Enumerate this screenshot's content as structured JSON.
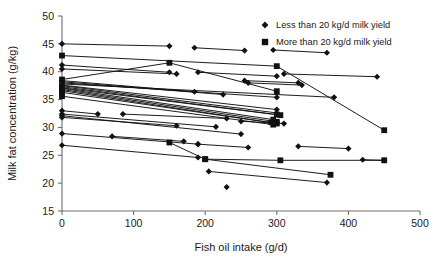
{
  "chart_data": {
    "type": "scatter",
    "title": "",
    "xlabel": "Fish oil intake (g/d)",
    "ylabel": "Milk fat concentration (g/kg)",
    "xlim": [
      0,
      500
    ],
    "ylim": [
      15,
      50
    ],
    "xticks": [
      0,
      100,
      200,
      300,
      400,
      500
    ],
    "yticks": [
      15,
      20,
      25,
      30,
      35,
      40,
      45,
      50
    ],
    "grid": false,
    "legend_position": "top-right",
    "legend": [
      {
        "label": "Less than 20 kg/d milk yield",
        "marker": "diamond",
        "color": "#111111"
      },
      {
        "label": "More than 20 kg/d milk yield",
        "marker": "square",
        "color": "#111111"
      }
    ],
    "series": [
      {
        "name": "study-1",
        "marker": "diamond",
        "points": [
          [
            0,
            45.0
          ],
          [
            150,
            44.6
          ]
        ]
      },
      {
        "name": "study-2",
        "marker": "diamond",
        "points": [
          [
            185,
            44.3
          ],
          [
            255,
            43.8
          ]
        ]
      },
      {
        "name": "study-3",
        "marker": "diamond",
        "points": [
          [
            295,
            43.9
          ],
          [
            370,
            43.4
          ]
        ]
      },
      {
        "name": "study-4",
        "marker": "square",
        "points": [
          [
            0,
            42.9
          ],
          [
            300,
            41.0
          ],
          [
            450,
            29.5
          ]
        ]
      },
      {
        "name": "study-5",
        "marker": "diamond",
        "points": [
          [
            0,
            41.2
          ],
          [
            150,
            39.9
          ]
        ]
      },
      {
        "name": "study-6",
        "marker": "diamond",
        "points": [
          [
            0,
            40.5
          ],
          [
            160,
            39.6
          ]
        ]
      },
      {
        "name": "study-7",
        "marker": "diamond",
        "points": [
          [
            190,
            39.9
          ],
          [
            300,
            39.2
          ]
        ]
      },
      {
        "name": "study-8",
        "marker": "diamond",
        "points": [
          [
            310,
            39.6
          ],
          [
            440,
            39.1
          ]
        ]
      },
      {
        "name": "study-9",
        "marker": "diamond",
        "points": [
          [
            255,
            38.4
          ],
          [
            330,
            38.0
          ]
        ]
      },
      {
        "name": "study-10",
        "marker": "diamond",
        "points": [
          [
            260,
            38.0
          ],
          [
            335,
            37.6
          ]
        ]
      },
      {
        "name": "study-11",
        "marker": "square",
        "points": [
          [
            0,
            38.6
          ],
          [
            150,
            41.6
          ],
          [
            300,
            36.5
          ]
        ]
      },
      {
        "name": "study-12",
        "marker": "diamond",
        "points": [
          [
            0,
            38.4
          ],
          [
            185,
            36.4
          ]
        ]
      },
      {
        "name": "study-13",
        "marker": "diamond",
        "points": [
          [
            0,
            38.2
          ],
          [
            225,
            35.9
          ]
        ]
      },
      {
        "name": "study-14",
        "marker": "diamond",
        "points": [
          [
            0,
            38.0
          ],
          [
            300,
            35.4
          ]
        ]
      },
      {
        "name": "study-15",
        "marker": "diamond",
        "points": [
          [
            0,
            37.8
          ],
          [
            380,
            35.4
          ]
        ]
      },
      {
        "name": "study-16",
        "marker": "diamond",
        "points": [
          [
            0,
            37.6
          ],
          [
            300,
            33.2
          ]
        ]
      },
      {
        "name": "study-17",
        "marker": "diamond",
        "points": [
          [
            0,
            37.5
          ],
          [
            300,
            32.6
          ]
        ]
      },
      {
        "name": "study-18",
        "marker": "square",
        "points": [
          [
            0,
            37.3
          ],
          [
            300,
            32.3
          ]
        ]
      },
      {
        "name": "study-19",
        "marker": "square",
        "points": [
          [
            0,
            37.1
          ],
          [
            305,
            32.2
          ]
        ]
      },
      {
        "name": "study-20",
        "marker": "square",
        "points": [
          [
            0,
            37.0
          ],
          [
            295,
            31.4
          ]
        ]
      },
      {
        "name": "study-21",
        "marker": "square",
        "points": [
          [
            0,
            36.8
          ],
          [
            300,
            31.0
          ]
        ]
      },
      {
        "name": "study-22",
        "marker": "diamond",
        "points": [
          [
            0,
            36.6
          ],
          [
            290,
            30.9
          ]
        ]
      },
      {
        "name": "study-23",
        "marker": "square",
        "points": [
          [
            0,
            36.3
          ],
          [
            300,
            30.7
          ]
        ]
      },
      {
        "name": "study-24",
        "marker": "square",
        "points": [
          [
            0,
            35.6
          ],
          [
            295,
            30.5
          ]
        ]
      },
      {
        "name": "study-25",
        "marker": "diamond",
        "points": [
          [
            0,
            33.0
          ],
          [
            50,
            32.4
          ]
        ]
      },
      {
        "name": "study-26",
        "marker": "diamond",
        "points": [
          [
            0,
            32.4
          ],
          [
            215,
            30.1
          ]
        ]
      },
      {
        "name": "study-27",
        "marker": "diamond",
        "points": [
          [
            85,
            32.4
          ],
          [
            230,
            31.6
          ]
        ]
      },
      {
        "name": "study-28",
        "marker": "diamond",
        "points": [
          [
            0,
            32.1
          ],
          [
            250,
            28.8
          ]
        ]
      },
      {
        "name": "study-29",
        "marker": "diamond",
        "points": [
          [
            0,
            31.8
          ],
          [
            160,
            30.3
          ]
        ]
      },
      {
        "name": "study-30",
        "marker": "diamond",
        "points": [
          [
            250,
            31.1
          ],
          [
            310,
            30.7
          ]
        ]
      },
      {
        "name": "study-31",
        "marker": "diamond",
        "points": [
          [
            0,
            28.9
          ],
          [
            190,
            27.0
          ]
        ]
      },
      {
        "name": "study-32",
        "marker": "diamond",
        "points": [
          [
            70,
            28.4
          ],
          [
            170,
            27.5
          ]
        ]
      },
      {
        "name": "study-33",
        "marker": "square",
        "points": [
          [
            150,
            27.3
          ],
          [
            200,
            24.3
          ],
          [
            305,
            24.1
          ],
          [
            450,
            24.1
          ]
        ]
      },
      {
        "name": "study-34",
        "marker": "square",
        "points": [
          [
            200,
            24.3
          ],
          [
            375,
            21.5
          ]
        ]
      },
      {
        "name": "study-35",
        "marker": "diamond",
        "points": [
          [
            205,
            22.1
          ],
          [
            370,
            20.1
          ]
        ]
      },
      {
        "name": "study-36",
        "marker": "diamond",
        "points": [
          [
            0,
            26.8
          ],
          [
            190,
            24.6
          ]
        ]
      },
      {
        "name": "study-37",
        "marker": "diamond",
        "points": [
          [
            230,
            19.3
          ]
        ]
      },
      {
        "name": "study-38",
        "marker": "diamond",
        "points": [
          [
            420,
            24.2
          ],
          [
            450,
            24.1
          ]
        ]
      },
      {
        "name": "study-39",
        "marker": "diamond",
        "points": [
          [
            190,
            27.0
          ],
          [
            260,
            26.4
          ]
        ]
      },
      {
        "name": "study-40",
        "marker": "diamond",
        "points": [
          [
            330,
            26.6
          ],
          [
            400,
            26.2
          ]
        ]
      }
    ]
  }
}
